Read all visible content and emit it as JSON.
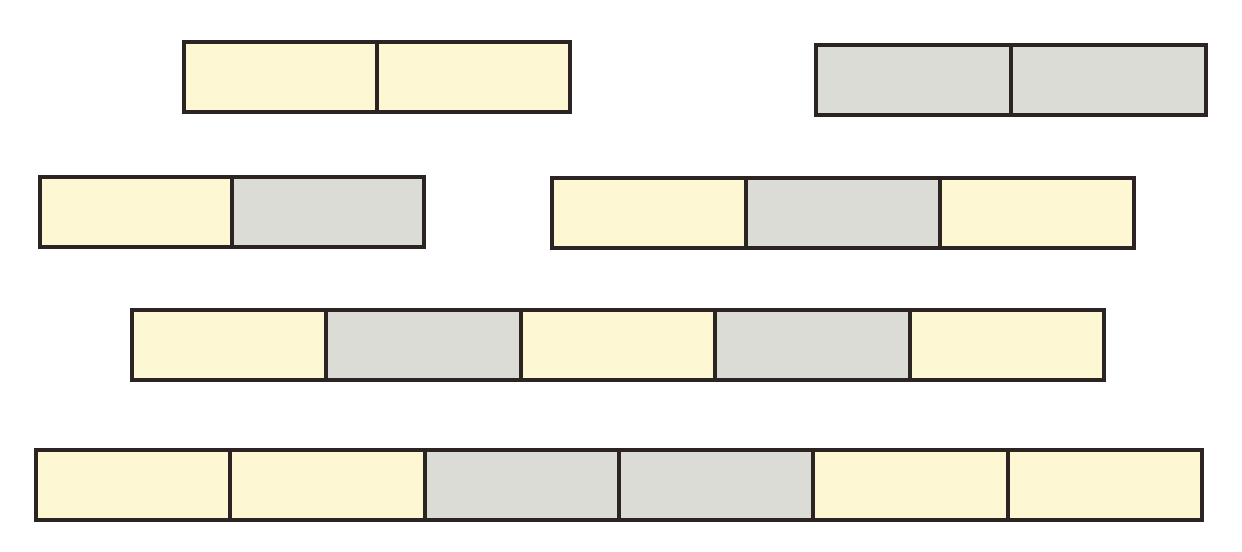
{
  "diagram": {
    "title": "",
    "colors": {
      "yellow": "#fdf7d3",
      "gray": "#dcdcd6",
      "outline": "#2b2422"
    },
    "bars": [
      {
        "id": "bar-1",
        "cells": [
          "yellow",
          "yellow"
        ]
      },
      {
        "id": "bar-2",
        "cells": [
          "gray",
          "gray"
        ]
      },
      {
        "id": "bar-3",
        "cells": [
          "yellow",
          "gray"
        ]
      },
      {
        "id": "bar-4",
        "cells": [
          "yellow",
          "gray",
          "yellow"
        ]
      },
      {
        "id": "bar-5",
        "cells": [
          "yellow",
          "gray",
          "yellow",
          "gray",
          "yellow"
        ]
      },
      {
        "id": "bar-6",
        "cells": [
          "yellow",
          "yellow",
          "gray",
          "gray",
          "yellow",
          "yellow"
        ]
      }
    ]
  }
}
